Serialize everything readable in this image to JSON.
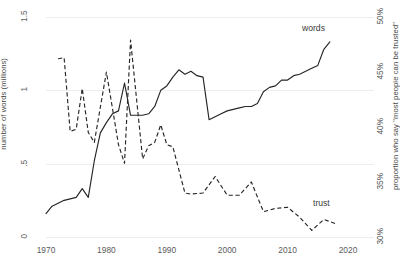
{
  "chart_data": {
    "type": "line",
    "title": "",
    "xlabel": "",
    "ylabel": "number of words (millions)",
    "y2label": "proportion who say \"most people can be trusted\"",
    "xlim": [
      1968,
      2022
    ],
    "ylim": [
      0,
      1.5
    ],
    "y2lim": [
      30,
      50
    ],
    "grid": true,
    "legend_position": "inline-right",
    "xticks": [
      "1970",
      "1980",
      "1990",
      "2000",
      "2010",
      "2020"
    ],
    "xtick_values": [
      1970,
      1980,
      1990,
      2000,
      2010,
      2020
    ],
    "yticks": [
      "0",
      ".5",
      "1",
      "1.5"
    ],
    "ytick_values": [
      0,
      0.5,
      1,
      1.5
    ],
    "y2ticks": [
      "30%",
      "35%",
      "40%",
      "45%",
      "50%"
    ],
    "y2tick_values": [
      30,
      35,
      40,
      45,
      50
    ],
    "series": [
      {
        "name": "words",
        "label": "words",
        "axis": "left",
        "style": "solid",
        "color": "#262626",
        "x": [
          1970,
          1971,
          1972,
          1973,
          1974,
          1975,
          1976,
          1977,
          1978,
          1979,
          1980,
          1981,
          1982,
          1983,
          1984,
          1985,
          1986,
          1987,
          1988,
          1989,
          1990,
          1991,
          1992,
          1993,
          1994,
          1995,
          1996,
          1997,
          1998,
          1999,
          2000,
          2001,
          2002,
          2003,
          2004,
          2005,
          2006,
          2007,
          2008,
          2009,
          2010,
          2011,
          2012,
          2013,
          2014,
          2015,
          2016,
          2017
        ],
        "values": [
          0.16,
          0.21,
          0.23,
          0.25,
          0.26,
          0.27,
          0.33,
          0.27,
          0.52,
          0.71,
          0.78,
          0.84,
          0.86,
          1.05,
          0.83,
          0.83,
          0.83,
          0.84,
          0.89,
          1.0,
          1.03,
          1.09,
          1.14,
          1.11,
          1.13,
          1.1,
          1.09,
          0.8,
          0.82,
          0.84,
          0.86,
          0.87,
          0.88,
          0.89,
          0.89,
          0.91,
          0.99,
          1.02,
          1.03,
          1.07,
          1.07,
          1.1,
          1.11,
          1.13,
          1.15,
          1.17,
          1.28,
          1.33
        ]
      },
      {
        "name": "trust",
        "label": "trust",
        "axis": "right",
        "style": "dashed",
        "color": "#262626",
        "x": [
          1972,
          1973,
          1974,
          1975,
          1976,
          1977,
          1978,
          1980,
          1982,
          1983,
          1984,
          1986,
          1987,
          1988,
          1989,
          1990,
          1991,
          1993,
          1994,
          1996,
          1998,
          2000,
          2002,
          2004,
          2006,
          2008,
          2010,
          2012,
          2014,
          2016,
          2018
        ],
        "values": [
          46.2,
          46.3,
          39.6,
          39.8,
          43.5,
          39.5,
          38.6,
          45.0,
          38.4,
          36.7,
          47.9,
          37.1,
          38.3,
          38.6,
          40.2,
          38.4,
          38.2,
          34.0,
          33.9,
          34.0,
          35.5,
          33.8,
          33.8,
          35.0,
          32.3,
          32.6,
          32.7,
          31.8,
          30.6,
          31.6,
          31.2
        ]
      }
    ]
  },
  "axes": {
    "left_title": "number of words (millions)",
    "right_title": "proportion who say \"most people can be trusted\"",
    "x_ticks": [
      {
        "label": "1970",
        "value": 1970
      },
      {
        "label": "1980",
        "value": 1980
      },
      {
        "label": "1990",
        "value": 1990
      },
      {
        "label": "2000",
        "value": 2000
      },
      {
        "label": "2010",
        "value": 2010
      },
      {
        "label": "2020",
        "value": 2020
      }
    ],
    "y_left_ticks": [
      {
        "label": "0",
        "value": 0
      },
      {
        "label": ".5",
        "value": 0.5
      },
      {
        "label": "1",
        "value": 1
      },
      {
        "label": "1.5",
        "value": 1.5
      }
    ],
    "y_right_ticks": [
      {
        "label": "30%",
        "value": 30
      },
      {
        "label": "35%",
        "value": 35
      },
      {
        "label": "40%",
        "value": 40
      },
      {
        "label": "45%",
        "value": 45
      },
      {
        "label": "50%",
        "value": 50
      }
    ]
  },
  "annotations": {
    "words_label": "words",
    "trust_label": "trust"
  },
  "colors": {
    "line": "#262626",
    "grid": "#eceef0",
    "text": "#4a4a4a",
    "background": "#ffffff"
  }
}
